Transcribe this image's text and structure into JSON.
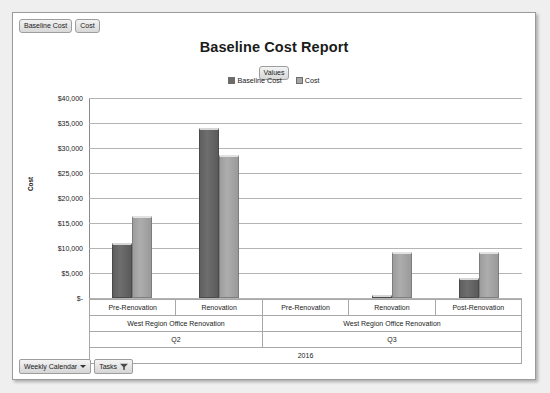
{
  "window": {
    "background": "#efefef",
    "panel_background": "#ffffff"
  },
  "top_filters": [
    {
      "label": "Baseline Cost"
    },
    {
      "label": "Cost"
    }
  ],
  "header": {
    "title": "Baseline Cost Report",
    "values_pill": "Values"
  },
  "bottom_bar": {
    "view_selector": "Weekly Calendar",
    "tasks_button": "Tasks"
  },
  "colors": {
    "baseline_cost": "#6b6b6b",
    "cost": "#a6a6a6",
    "gridline": "#b4b4b4",
    "axis": "#8a8a8a",
    "text": "#222222"
  },
  "chart_data": {
    "type": "bar",
    "title": "Baseline Cost Report",
    "xlabel": "",
    "ylabel": "Cost",
    "ylim": [
      0,
      40000
    ],
    "ytick_labels": [
      "$40,000",
      "$35,000",
      "$30,000",
      "$25,000",
      "$20,000",
      "$15,000",
      "$10,000",
      "$5,000",
      "$-"
    ],
    "ytick_values": [
      40000,
      35000,
      30000,
      25000,
      20000,
      15000,
      10000,
      5000,
      0
    ],
    "grid": true,
    "legend_position": "top-center",
    "legend": [
      "Baseline Cost",
      "Cost"
    ],
    "year": "2016",
    "categories": [
      "Pre-Renovation",
      "Renovation",
      "Pre-Renovation",
      "Renovation",
      "Post-Renovation"
    ],
    "groups": [
      {
        "quarter": "Q2",
        "project": "West Region Office Renovation",
        "categories": [
          "Pre-Renovation",
          "Renovation"
        ]
      },
      {
        "quarter": "Q3",
        "project": "West Region Office Renovation",
        "categories": [
          "Pre-Renovation",
          "Renovation",
          "Post-Renovation"
        ]
      }
    ],
    "series": [
      {
        "name": "Baseline Cost",
        "color": "#6b6b6b",
        "values": [
          11000,
          34000,
          0,
          300,
          4000
        ]
      },
      {
        "name": "Cost",
        "color": "#a6a6a6",
        "values": [
          16500,
          28700,
          0,
          9200,
          9300
        ]
      }
    ]
  }
}
